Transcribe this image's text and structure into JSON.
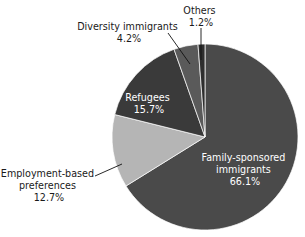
{
  "chart_data": {
    "type": "pie",
    "title": "",
    "subtitle": "",
    "xlabel": "",
    "ylabel": "",
    "legend_position": "none",
    "grid": false,
    "units": "percent",
    "total": 99.9,
    "categories": [
      "Family-sponsored immigrants",
      "Employment-based preferences",
      "Refugees",
      "Diversity immigrants",
      "Others"
    ],
    "values": [
      66.1,
      12.7,
      15.7,
      4.2,
      1.2
    ],
    "value_labels": [
      "66.1%",
      "12.7%",
      "15.7%",
      "4.2%",
      "1.2%"
    ],
    "colors": [
      "#4a4a4a",
      "#b5b5b5",
      "#3a3a3a",
      "#5a5a5a",
      "#2e2e2e"
    ],
    "slices": [
      {
        "name": "family-sponsored",
        "label_lines": [
          "Family-sponsored",
          "immigrants"
        ],
        "value": 66.1,
        "value_label": "66.1%",
        "color": "#4a4a4a",
        "label_placement": "inside",
        "label_color": "#ffffff"
      },
      {
        "name": "employment-based",
        "label_lines": [
          "Employment-based",
          "preferences"
        ],
        "value": 12.7,
        "value_label": "12.7%",
        "color": "#b5b5b5",
        "label_placement": "outside",
        "label_color": "#1a1a1a"
      },
      {
        "name": "refugees",
        "label_lines": [
          "Refugees"
        ],
        "value": 15.7,
        "value_label": "15.7%",
        "color": "#3a3a3a",
        "label_placement": "inside",
        "label_color": "#ffffff"
      },
      {
        "name": "diversity-immigrants",
        "label_lines": [
          "Diversity immigrants"
        ],
        "value": 4.2,
        "value_label": "4.2%",
        "color": "#5a5a5a",
        "label_placement": "outside",
        "label_color": "#1a1a1a"
      },
      {
        "name": "others",
        "label_lines": [
          "Others"
        ],
        "value": 1.2,
        "value_label": "1.2%",
        "color": "#2e2e2e",
        "label_placement": "outside",
        "label_color": "#1a1a1a"
      }
    ]
  },
  "labels": {
    "family_sponsored_line1": "Family-sponsored",
    "family_sponsored_line2": "immigrants",
    "family_sponsored_value": "66.1%",
    "employment_line1": "Employment-based",
    "employment_line2": "preferences",
    "employment_value": "12.7%",
    "refugees_line1": "Refugees",
    "refugees_value": "15.7%",
    "diversity_line1": "Diversity immigrants",
    "diversity_value": "4.2%",
    "others_line1": "Others",
    "others_value": "1.2%"
  },
  "geometry": {
    "center_x": 205,
    "center_y": 137,
    "radius": 93,
    "start_angle_deg": 0
  }
}
